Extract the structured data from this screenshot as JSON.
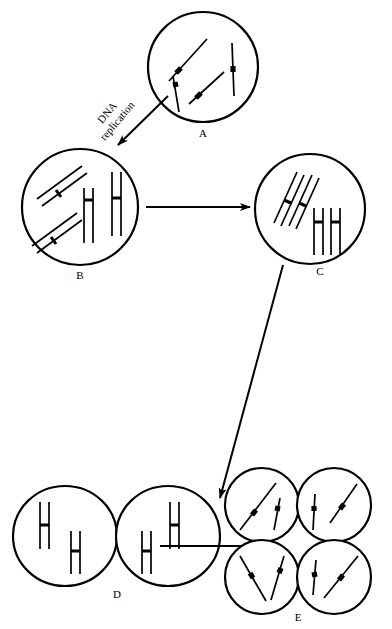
{
  "diagram": {
    "background_color": "#ffffff",
    "line_color": "#000000",
    "stages": [
      {
        "id": "A",
        "label": "A",
        "description": "single cell with four unreplicated chromosomes",
        "cell_count": 1,
        "chromosomes_per_cell": 4,
        "chromosome_type": "single",
        "center": [
          203,
          67
        ],
        "radius": 55
      },
      {
        "id": "B",
        "label": "B",
        "description": "single cell with four replicated chromosomes (sister chromatids)",
        "cell_count": 1,
        "chromosomes_per_cell": 4,
        "chromosome_type": "replicated",
        "center": [
          80,
          207
        ],
        "radius": 58
      },
      {
        "id": "C",
        "label": "C",
        "description": "single cell with homologous chromosomes paired in synapsis",
        "cell_count": 1,
        "chromosomes_per_cell": 4,
        "chromosome_type": "paired",
        "center": [
          310,
          209
        ],
        "radius": 55
      },
      {
        "id": "D",
        "label": "D",
        "description": "two daughter cells each with two replicated chromosomes",
        "cell_count": 2,
        "chromosomes_per_cell": 2,
        "chromosome_type": "replicated",
        "center": [
          100,
          536
        ],
        "radius": 52
      },
      {
        "id": "E",
        "label": "E",
        "description": "four haploid cells each with two unreplicated chromosomes",
        "cell_count": 4,
        "chromosomes_per_cell": 2,
        "chromosome_type": "single",
        "center": [
          298,
          541
        ],
        "radius": 37
      }
    ],
    "connectors": [
      {
        "id": "a-to-b",
        "from": "A",
        "to": "B",
        "style": "arrow",
        "label_line1": "DNA",
        "label_line2": "replication",
        "label_rotation_deg": -50
      },
      {
        "id": "b-to-c",
        "from": "B",
        "to": "C",
        "style": "arrow",
        "label_line1": "",
        "label_line2": ""
      },
      {
        "id": "c-to-d",
        "from": "C",
        "to": "D",
        "style": "arrow",
        "label_line1": "",
        "label_line2": ""
      },
      {
        "id": "d-to-e",
        "from": "D",
        "to": "E",
        "style": "line",
        "label_line1": "",
        "label_line2": ""
      }
    ]
  }
}
